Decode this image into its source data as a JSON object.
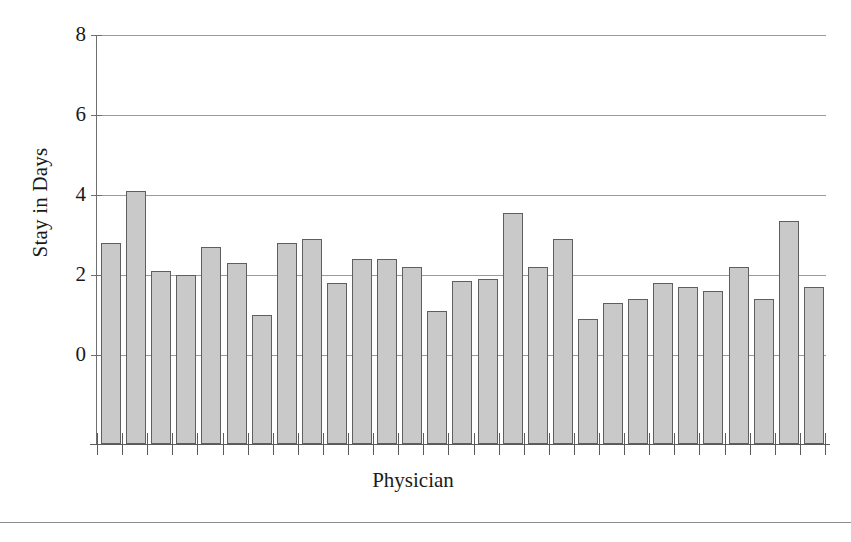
{
  "chart_data": {
    "type": "bar",
    "title": "",
    "xlabel": "Physician",
    "ylabel": "Stay in Days",
    "ylim": [
      0,
      8
    ],
    "yticks": [
      0,
      2,
      4,
      6,
      8
    ],
    "ytick_labels": [
      "0",
      "2",
      "4",
      "6",
      "8"
    ],
    "grid": true,
    "legend": "none",
    "xtick_labels": [],
    "categories": [
      "1",
      "2",
      "3",
      "4",
      "5",
      "6",
      "7",
      "8",
      "9",
      "10",
      "11",
      "12",
      "13",
      "14",
      "15",
      "16",
      "17",
      "18",
      "19",
      "20",
      "21",
      "22",
      "23",
      "24",
      "25",
      "26",
      "27",
      "28",
      "29"
    ],
    "values": [
      2.8,
      4.1,
      2.1,
      2.0,
      2.7,
      2.3,
      1.0,
      2.8,
      2.9,
      1.8,
      2.4,
      2.4,
      2.2,
      1.1,
      1.85,
      1.9,
      3.55,
      2.2,
      2.9,
      0.9,
      1.3,
      1.4,
      1.8,
      1.7,
      1.6,
      2.2,
      1.4,
      3.35,
      1.7
    ],
    "bar_fill_color": "#c9c9c9",
    "bar_edge_color": "#5f5f5f",
    "gridline_color": "#9a9a9a",
    "axis_color": "#6f6f6f",
    "background_color": "#ffffff"
  },
  "figure": {
    "footer_rule": ""
  }
}
